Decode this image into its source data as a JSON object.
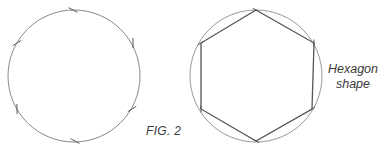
{
  "figure": {
    "caption": "FIG. 2",
    "annotation": {
      "line1": "Hexagon",
      "line2": "shape"
    }
  },
  "diagram": {
    "stroke_color": "#555555",
    "circle_color": "#8a8a8a",
    "left_circle": {
      "cx": 74,
      "cy": 76,
      "r": 66,
      "tick_marks": [
        [
          73,
          10
        ],
        [
          133,
          43
        ],
        [
          132,
          109
        ],
        [
          75,
          141
        ],
        [
          17,
          109
        ],
        [
          17,
          43
        ]
      ]
    },
    "right_circle": {
      "cx": 256,
      "cy": 76,
      "r": 66,
      "hexagon_vertices": [
        [
          256,
          10
        ],
        [
          314,
          43
        ],
        [
          312,
          109
        ],
        [
          256,
          141
        ],
        [
          201,
          109
        ],
        [
          201,
          43
        ]
      ]
    }
  }
}
